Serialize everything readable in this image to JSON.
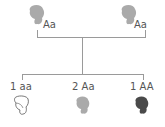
{
  "diagram": {
    "type": "genetic-cross",
    "parents": [
      {
        "genotype": "Aa",
        "shape": "gray-blob",
        "color": "#a8a8a8"
      },
      {
        "genotype": "Aa",
        "shape": "gray-blob",
        "color": "#a8a8a8"
      }
    ],
    "offspring": [
      {
        "label": "1 aa",
        "ratio": 1,
        "genotype": "aa",
        "shape": "outline-blob",
        "color": "#ffffff"
      },
      {
        "label": "2 Aa",
        "ratio": 2,
        "genotype": "Aa",
        "shape": "gray-blob",
        "color": "#a8a8a8"
      },
      {
        "label": "1 AA",
        "ratio": 1,
        "genotype": "AA",
        "shape": "dark-blob",
        "color": "#4a4a4a"
      }
    ],
    "line_color": "#9a9a9a"
  }
}
